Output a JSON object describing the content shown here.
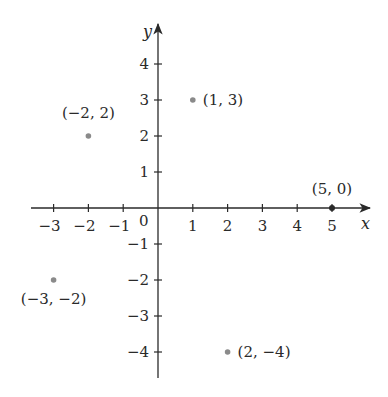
{
  "chart_data": {
    "type": "scatter",
    "title": "",
    "xlabel": "x",
    "ylabel": "y",
    "xlim": [
      -3.7,
      6.1
    ],
    "ylim": [
      -4.7,
      5.0
    ],
    "grid": false,
    "legend": null,
    "x_ticks": [
      -3,
      -2,
      -1,
      1,
      2,
      3,
      4,
      5
    ],
    "x_tick_labels": [
      "−3",
      "−2",
      "−1",
      "1",
      "2",
      "3",
      "4",
      "5"
    ],
    "y_ticks": [
      4,
      3,
      2,
      1,
      -1,
      -2,
      -3,
      -4
    ],
    "y_tick_labels": [
      "4",
      "3",
      "2",
      "1",
      "−1",
      "−2",
      "−3",
      "−4"
    ],
    "origin_label": "0",
    "points": [
      {
        "x": -2,
        "y": 2,
        "label": "(−2, 2)"
      },
      {
        "x": 1,
        "y": 3,
        "label": "(1, 3)"
      },
      {
        "x": 5,
        "y": 0,
        "label": "(5, 0)"
      },
      {
        "x": -3,
        "y": -2,
        "label": "(−3, −2)"
      },
      {
        "x": 2,
        "y": -4,
        "label": "(2, −4)"
      }
    ]
  },
  "colors": {
    "axis": "#2a2a2a",
    "point": "#8a8a8a",
    "text": "#2a2a2a"
  }
}
